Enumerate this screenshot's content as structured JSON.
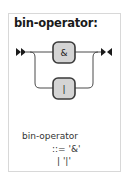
{
  "panel": {
    "title": "bin-operator:"
  },
  "diagram": {
    "start_marker": "double-right-arrow",
    "end_marker": "arrow-bar-arrow",
    "choices": [
      {
        "label": "&"
      },
      {
        "label": "|"
      }
    ],
    "colors": {
      "line": "#4a4a4a",
      "node_fill": "#d4d4d4",
      "node_stroke": "#3a3a3a",
      "marker": "#1a1a1a"
    }
  },
  "grammar": {
    "rule_name": "bin-operator",
    "definition": "::= '&'",
    "alternative": "| '|'"
  }
}
